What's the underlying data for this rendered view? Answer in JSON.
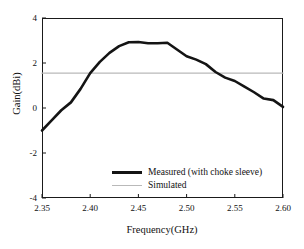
{
  "chart_data": {
    "type": "line",
    "title": "",
    "xlabel": "Frequency(GHz)",
    "ylabel": "Gain(dBi)",
    "xlim": [
      2.35,
      2.6
    ],
    "ylim": [
      -4,
      4
    ],
    "xticks": [
      "2.35",
      "2.40",
      "2.45",
      "2.50",
      "2.55",
      "2.60"
    ],
    "xtick_values": [
      2.35,
      2.4,
      2.45,
      2.5,
      2.55,
      2.6
    ],
    "yticks": [
      "4",
      "2",
      "0",
      "-2",
      "-4"
    ],
    "ytick_values": [
      4,
      2,
      0,
      -2,
      -4
    ],
    "grid": false,
    "legend_position": "lower-center-right",
    "series": [
      {
        "name": "Measured (with choke sleeve)",
        "color": "#141414",
        "style": "thick-solid",
        "x": [
          2.35,
          2.36,
          2.37,
          2.38,
          2.39,
          2.4,
          2.41,
          2.42,
          2.43,
          2.44,
          2.45,
          2.46,
          2.47,
          2.48,
          2.49,
          2.5,
          2.51,
          2.52,
          2.53,
          2.54,
          2.55,
          2.56,
          2.57,
          2.58,
          2.59,
          2.6
        ],
        "values": [
          -1.0,
          -0.55,
          -0.1,
          0.25,
          0.85,
          1.55,
          2.05,
          2.45,
          2.75,
          2.92,
          2.93,
          2.88,
          2.88,
          2.9,
          2.6,
          2.3,
          2.15,
          1.95,
          1.6,
          1.35,
          1.2,
          0.95,
          0.7,
          0.42,
          0.35,
          0.05
        ]
      },
      {
        "name": "Simulated",
        "color": "#b9b9b9",
        "style": "thin-solid-horizontal",
        "x": [
          2.35,
          2.6
        ],
        "values": [
          1.55,
          1.55
        ]
      }
    ]
  },
  "legend": {
    "items": [
      {
        "label": "Measured (with choke sleeve)"
      },
      {
        "label": "Simulated"
      }
    ]
  }
}
